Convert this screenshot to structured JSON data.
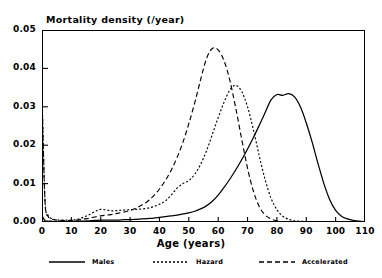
{
  "chart_data": {
    "type": "line",
    "title": "Mortality  density  (/year)",
    "xlabel": "Age  (years)",
    "ylabel": "",
    "xlim": [
      0,
      110
    ],
    "ylim": [
      0,
      0.05
    ],
    "xticks": [
      0,
      10,
      20,
      30,
      40,
      50,
      60,
      70,
      80,
      90,
      100,
      110
    ],
    "yticks": [
      "0.00",
      "0.01",
      "0.02",
      "0.03",
      "0.04",
      "0.05"
    ],
    "grid": false,
    "legend_position": "below",
    "x": [
      0,
      1,
      2,
      3,
      4,
      5,
      6,
      8,
      10,
      12,
      14,
      16,
      18,
      20,
      22,
      24,
      26,
      28,
      30,
      32,
      34,
      36,
      38,
      40,
      42,
      44,
      46,
      48,
      50,
      52,
      54,
      56,
      58,
      60,
      62,
      64,
      66,
      68,
      70,
      72,
      74,
      76,
      78,
      80,
      82,
      84,
      86,
      88,
      90,
      92,
      94,
      96,
      98,
      100,
      102,
      104,
      106,
      108,
      110
    ],
    "series": [
      {
        "name": "Males",
        "style": "solid",
        "values": [
          0.0016,
          0.0004,
          0.0002,
          0.0002,
          0.0001,
          0.0001,
          0.0001,
          0.0001,
          0.0001,
          0.0002,
          0.0002,
          0.0003,
          0.0004,
          0.0005,
          0.0005,
          0.0005,
          0.0005,
          0.0006,
          0.0006,
          0.0007,
          0.0008,
          0.0009,
          0.001,
          0.0012,
          0.0014,
          0.0016,
          0.0018,
          0.0021,
          0.0024,
          0.0028,
          0.0034,
          0.0042,
          0.0054,
          0.007,
          0.009,
          0.0112,
          0.0136,
          0.0162,
          0.019,
          0.022,
          0.0252,
          0.0285,
          0.0318,
          0.0332,
          0.033,
          0.0334,
          0.0326,
          0.03,
          0.0258,
          0.0208,
          0.0152,
          0.01,
          0.0058,
          0.003,
          0.0015,
          0.0008,
          0.0004,
          0.0002,
          0.0001
        ]
      },
      {
        "name": "Hazard",
        "style": "dotted",
        "values": [
          0.033,
          0.006,
          0.0018,
          0.001,
          0.0007,
          0.0006,
          0.0005,
          0.0005,
          0.0005,
          0.0007,
          0.0012,
          0.0019,
          0.0027,
          0.0033,
          0.0031,
          0.0029,
          0.003,
          0.0031,
          0.0032,
          0.0033,
          0.0034,
          0.0036,
          0.004,
          0.0046,
          0.0055,
          0.007,
          0.0088,
          0.01,
          0.0108,
          0.0124,
          0.015,
          0.0185,
          0.0228,
          0.0272,
          0.0312,
          0.0344,
          0.0356,
          0.034,
          0.03,
          0.024,
          0.0172,
          0.011,
          0.0062,
          0.0032,
          0.0015,
          0.0007,
          0.0003,
          0.0002,
          0.0001,
          0.0001,
          0.0,
          0.0,
          0.0,
          0.0,
          0.0,
          0.0,
          0.0,
          0.0,
          0.0
        ]
      },
      {
        "name": "Accelerated",
        "style": "dashed",
        "values": [
          0.0332,
          0.0055,
          0.0016,
          0.0009,
          0.0006,
          0.0005,
          0.0004,
          0.0004,
          0.0004,
          0.0005,
          0.0007,
          0.001,
          0.0013,
          0.0016,
          0.0018,
          0.002,
          0.0023,
          0.0026,
          0.003,
          0.0036,
          0.0044,
          0.0054,
          0.0068,
          0.0086,
          0.0108,
          0.0135,
          0.0168,
          0.0208,
          0.0256,
          0.031,
          0.037,
          0.0425,
          0.0452,
          0.0448,
          0.042,
          0.0368,
          0.0296,
          0.0216,
          0.014,
          0.008,
          0.004,
          0.0018,
          0.0008,
          0.0003,
          0.0001,
          0.0001,
          0.0,
          0.0,
          0.0,
          0.0,
          0.0,
          0.0,
          0.0,
          0.0,
          0.0,
          0.0,
          0.0,
          0.0,
          0.0
        ]
      }
    ],
    "annotations": [
      "Infant mortality spike at age 0 for Hazard and Accelerated curves",
      "Young-adult bump near age 20 in Hazard curve"
    ]
  },
  "colors": {
    "axis": "#000000",
    "males": "#000000",
    "hazard": "#000000",
    "accelerated": "#000000",
    "background": "#ffffff"
  }
}
